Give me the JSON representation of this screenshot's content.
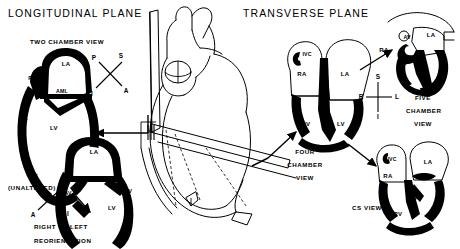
{
  "figure": {
    "type": "medical-anatomical-diagram",
    "background_color": "#ffffff",
    "ink_color": "#000000"
  },
  "titles": {
    "left": "LONGITUDINAL PLANE",
    "right": "TRANSVERSE PLANE"
  },
  "views": {
    "two_chamber": {
      "label": "TWO CHAMBER VIEW",
      "sublabel": "(UNALTERED)",
      "chambers": [
        "LA",
        "PML",
        "AML",
        "LV",
        "AV",
        "MV"
      ]
    },
    "reoriented": {
      "label_line1": "RIGHT TO LEFT",
      "label_line2": "REORIENTATION",
      "chambers": [
        "LA",
        "LV",
        "AV",
        "MV"
      ]
    },
    "four_chamber": {
      "label_line1": "FOUR",
      "label_line2": "CHAMBER",
      "label_line3": "VIEW",
      "chambers": [
        "IVC",
        "RA",
        "LA",
        "RV",
        "LV"
      ]
    },
    "five_chamber": {
      "label_line1": "FIVE",
      "label_line2": "CHAMBER",
      "label_line3": "VIEW",
      "chambers": [
        "RA",
        "AV",
        "LA",
        "RV",
        "LV"
      ]
    },
    "cs": {
      "label": "CS VIEW",
      "chambers": [
        "IVC",
        "RA",
        "LA",
        "CS",
        "RV",
        "LV"
      ]
    },
    "central": {
      "label": "III"
    }
  },
  "compasses": {
    "longitudinal_upper": {
      "top_right": "S",
      "left": "P",
      "bottom_right": "A",
      "bottom_left": "I"
    },
    "longitudinal_lower": {
      "top_left": "S",
      "right": "P",
      "bottom_left": "A",
      "bottom_right": "I"
    },
    "transverse": {
      "top": "S",
      "left": "R",
      "right": "L",
      "bottom": "I"
    }
  },
  "chamber_labels": {
    "LA": "LA",
    "LV": "LV",
    "RA": "RA",
    "RV": "RV",
    "AV": "AV",
    "MV": "MV",
    "PML": "PML",
    "AML": "AML",
    "IVC": "IVC",
    "CS": "CS"
  }
}
